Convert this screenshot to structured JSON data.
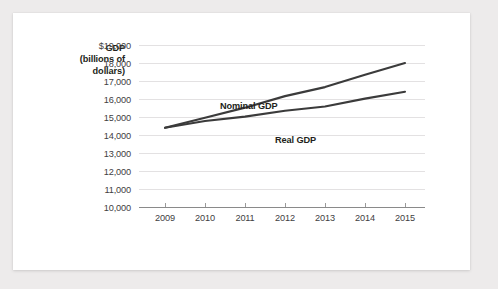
{
  "chart_data": {
    "type": "line",
    "title": "",
    "subtitle": "",
    "xlabel": "",
    "ylabel": "GDP (billions of dollars)",
    "ylabel_line1": "GDP",
    "ylabel_line2": "(billions of",
    "ylabel_line3": "dollars)",
    "categories": [
      "2009",
      "2010",
      "2011",
      "2012",
      "2013",
      "2014",
      "2015"
    ],
    "x": [
      2009,
      2010,
      2011,
      2012,
      2013,
      2014,
      2015
    ],
    "series": [
      {
        "name": "Nominal GDP",
        "values": [
          14400,
          14960,
          15520,
          16160,
          16660,
          17350,
          18000
        ],
        "color": "#3b3b3b"
      },
      {
        "name": "Real GDP",
        "values": [
          14400,
          14780,
          15020,
          15350,
          15580,
          16020,
          16400
        ],
        "color": "#3b3b3b"
      }
    ],
    "ylim": [
      10000,
      19000
    ],
    "ytick_values": [
      19000,
      18000,
      17000,
      16000,
      15000,
      14000,
      13000,
      12000,
      11000,
      10000
    ],
    "ytick_labels": [
      "$19,000",
      "18,000",
      "17,000",
      "16,000",
      "15,000",
      "14,000",
      "13,000",
      "12,000",
      "11,000",
      "10,000"
    ],
    "grid": true,
    "legend_position": "inline-annotation",
    "annotations": [
      {
        "text": "Nominal GDP",
        "x": 231,
        "y": 93
      },
      {
        "text": "Real GDP",
        "x": 272,
        "y": 127
      }
    ]
  },
  "colors": {
    "page_background": "#edebeb",
    "card_background": "#ffffff",
    "line": "#3b3b3b",
    "gridline": "#e3e1e2",
    "axis": "#8a8a8a",
    "tick_text": "#414042",
    "title_text": "#231f20"
  }
}
